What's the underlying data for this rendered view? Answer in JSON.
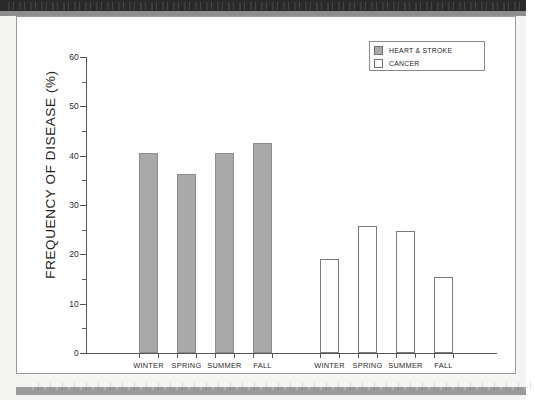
{
  "decor": {
    "top_band": "dark-scan-band",
    "bottom_band": "gray-scan-band"
  },
  "legend": {
    "position": "top-right",
    "entries": [
      {
        "label": "HEART & STROKE",
        "swatch": "filled-gray-square",
        "color": "#a9a9a9"
      },
      {
        "label": "CANCER",
        "swatch": "open-white-square",
        "color": "#ffffff"
      }
    ]
  },
  "axes": {
    "y_title": "FREQUENCY OF DISEASE (%)",
    "y_ticks": [
      "60",
      "50",
      "40",
      "30",
      "20",
      "10",
      "0"
    ],
    "y_minor_ticks": [
      "55",
      "45",
      "35",
      "25",
      "15",
      "5"
    ],
    "x_labels_group1": [
      "WINTER",
      "SPRING",
      "SUMMER",
      "FALL"
    ],
    "x_labels_group2": [
      "WINTER",
      "SPRING",
      "SUMMER",
      "FALL"
    ]
  },
  "chart_data": {
    "type": "bar",
    "title": "",
    "xlabel": "",
    "ylabel": "FREQUENCY OF DISEASE (%)",
    "ylim": [
      0,
      60
    ],
    "grid": false,
    "legend_position": "top-right",
    "categories": [
      "WINTER",
      "SPRING",
      "SUMMER",
      "FALL"
    ],
    "series": [
      {
        "name": "HEART & STROKE",
        "color": "#a9a9a9",
        "values": [
          40.5,
          36.2,
          40.6,
          42.5
        ]
      },
      {
        "name": "CANCER",
        "color": "#ffffff",
        "values": [
          19.1,
          25.8,
          24.7,
          15.4
        ]
      }
    ]
  }
}
